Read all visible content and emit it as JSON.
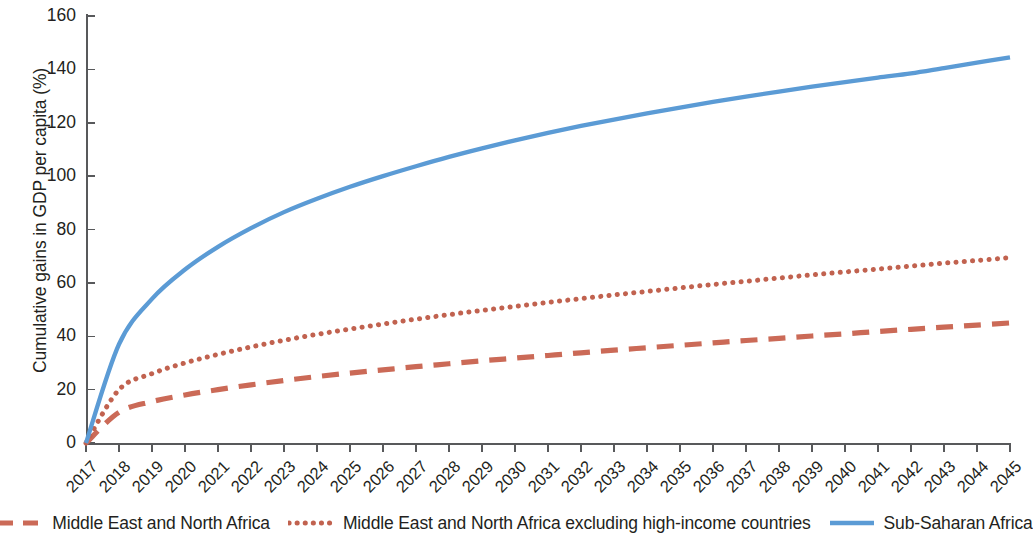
{
  "chart_data": {
    "type": "line",
    "title": "",
    "subtitle": "",
    "xlabel": "",
    "ylabel": "Cumulative gains in GDP per capita (%)",
    "x": [
      2017,
      2018,
      2019,
      2020,
      2021,
      2022,
      2023,
      2024,
      2025,
      2026,
      2027,
      2028,
      2029,
      2030,
      2031,
      2032,
      2033,
      2034,
      2035,
      2036,
      2037,
      2038,
      2039,
      2040,
      2041,
      2042,
      2043,
      2044,
      2045
    ],
    "xtick_labels": [
      "2017",
      "2018",
      "2019",
      "2020",
      "2021",
      "2022",
      "2023",
      "2024",
      "2025",
      "2026",
      "2027",
      "2028",
      "2029",
      "2030",
      "2031",
      "2032",
      "2033",
      "2034",
      "2035",
      "2036",
      "2037",
      "2038",
      "2039",
      "2040",
      "2041",
      "2042",
      "2043",
      "2044",
      "2045"
    ],
    "ytick_labels": [
      "0",
      "20",
      "40",
      "60",
      "80",
      "100",
      "120",
      "140",
      "160"
    ],
    "yticks": [
      0,
      20,
      40,
      60,
      80,
      100,
      120,
      140,
      160
    ],
    "ylim": [
      0,
      160
    ],
    "xlim": [
      2017,
      2045
    ],
    "grid": false,
    "legend_position": "bottom",
    "series": [
      {
        "name": "Middle East and North Africa",
        "color": "#cb6a57",
        "style": "dashed",
        "values": [
          0,
          11.5,
          15.5,
          18.0,
          20.0,
          21.8,
          23.4,
          24.9,
          26.2,
          27.4,
          28.6,
          29.7,
          30.8,
          31.8,
          32.8,
          33.8,
          34.8,
          35.7,
          36.6,
          37.5,
          38.4,
          39.2,
          40.1,
          40.9,
          41.8,
          42.6,
          43.4,
          44.2,
          45.0
        ]
      },
      {
        "name": "Middle East and North Africa excluding high-income countries",
        "color": "#c1624f",
        "style": "dotted",
        "values": [
          0,
          20.0,
          26.0,
          30.0,
          33.2,
          36.0,
          38.5,
          40.7,
          42.7,
          44.6,
          46.4,
          48.1,
          49.7,
          51.2,
          52.7,
          54.1,
          55.5,
          56.8,
          58.1,
          59.4,
          60.6,
          61.8,
          63.0,
          64.1,
          65.2,
          66.3,
          67.4,
          68.4,
          69.5
        ]
      },
      {
        "name": "Sub-Saharan Africa",
        "color": "#5b9bd5",
        "style": "solid",
        "values": [
          0,
          37.0,
          54.0,
          65.0,
          73.5,
          80.5,
          86.5,
          91.5,
          96.0,
          100.0,
          103.7,
          107.2,
          110.4,
          113.4,
          116.2,
          118.8,
          121.2,
          123.5,
          125.7,
          127.8,
          129.8,
          131.7,
          133.5,
          135.2,
          136.9,
          138.5,
          140.5,
          142.5,
          144.5
        ]
      }
    ]
  },
  "legend": {
    "items": [
      {
        "label": "Middle East and North Africa",
        "swatch": "dashed-line-swatch"
      },
      {
        "label": "Middle East and North Africa excluding high-income countries",
        "swatch": "dotted-line-swatch"
      },
      {
        "label": "Sub-Saharan Africa",
        "swatch": "solid-line-swatch"
      }
    ]
  },
  "colors": {
    "series_red_dashed": "#cb6a57",
    "series_red_dotted": "#c1624f",
    "series_blue_solid": "#5b9bd5",
    "axis": "#58595b",
    "text": "#231f20",
    "background": "#ffffff"
  }
}
